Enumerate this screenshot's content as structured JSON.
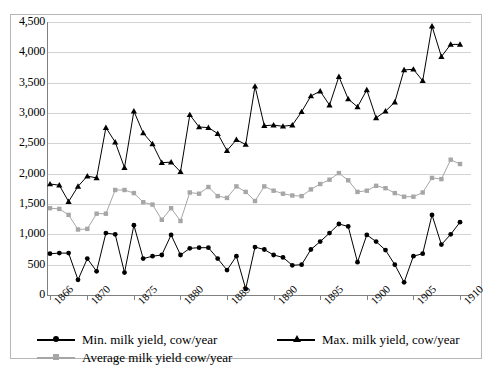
{
  "chart_data": {
    "type": "line",
    "title": "",
    "xlabel": "",
    "ylabel": "",
    "ylim": [
      0,
      4500
    ],
    "ytick_step": 500,
    "ytick_labels": [
      "4,500",
      "4,000",
      "3,500",
      "3,000",
      "2,500",
      "2,000",
      "1,500",
      "1,000",
      "500",
      "0"
    ],
    "ytick_values": [
      4500,
      4000,
      3500,
      3000,
      2500,
      2000,
      1500,
      1000,
      500,
      0
    ],
    "xtick_labels": [
      "1866",
      "1870",
      "1875",
      "1880",
      "1885",
      "1890",
      "1895",
      "1900",
      "1905",
      "1910"
    ],
    "xtick_values": [
      1866,
      1870,
      1875,
      1880,
      1885,
      1890,
      1895,
      1900,
      1905,
      1910
    ],
    "xlim": [
      1866,
      1910
    ],
    "grid": true,
    "legend_position": "bottom-left",
    "x": [
      1866,
      1867,
      1868,
      1869,
      1870,
      1871,
      1872,
      1873,
      1874,
      1875,
      1876,
      1877,
      1878,
      1879,
      1880,
      1881,
      1882,
      1883,
      1884,
      1885,
      1886,
      1887,
      1888,
      1889,
      1890,
      1891,
      1892,
      1893,
      1894,
      1895,
      1896,
      1897,
      1898,
      1899,
      1900,
      1901,
      1902,
      1903,
      1904,
      1905,
      1906,
      1907,
      1908,
      1909,
      1910
    ],
    "series": [
      {
        "name": "Min. milk yield, cow/year",
        "color": "#000000",
        "marker": "circle",
        "values": [
          680,
          690,
          690,
          250,
          600,
          390,
          1020,
          1000,
          370,
          1150,
          600,
          640,
          660,
          990,
          660,
          770,
          780,
          780,
          600,
          410,
          640,
          100,
          790,
          750,
          660,
          620,
          490,
          500,
          750,
          880,
          1020,
          1170,
          1130,
          540,
          990,
          880,
          740,
          500,
          210,
          640,
          680,
          1320,
          830,
          1000,
          1200
        ]
      },
      {
        "name": "Average milk yield cow/year",
        "color": "#a6a6a6",
        "marker": "square",
        "values": [
          1430,
          1420,
          1320,
          1080,
          1090,
          1340,
          1340,
          1730,
          1730,
          1680,
          1530,
          1490,
          1240,
          1430,
          1220,
          1690,
          1670,
          1780,
          1630,
          1600,
          1790,
          1700,
          1550,
          1790,
          1720,
          1670,
          1640,
          1630,
          1740,
          1830,
          1900,
          2010,
          1890,
          1700,
          1720,
          1800,
          1760,
          1680,
          1620,
          1620,
          1690,
          1930,
          1910,
          2230,
          2160
        ]
      },
      {
        "name": "Max. milk yield, cow/year",
        "color": "#000000",
        "marker": "triangle",
        "values": [
          1830,
          1810,
          1540,
          1790,
          1960,
          1930,
          2760,
          2520,
          2100,
          3030,
          2670,
          2490,
          2180,
          2190,
          2030,
          2970,
          2770,
          2760,
          2660,
          2380,
          2560,
          2480,
          3440,
          2790,
          2800,
          2780,
          2800,
          3020,
          3280,
          3360,
          3130,
          3600,
          3230,
          3100,
          3380,
          2920,
          3030,
          3180,
          3710,
          3720,
          3530,
          4430,
          3930,
          4130,
          4130
        ]
      }
    ]
  },
  "legend": {
    "items": [
      {
        "label": "Min. milk yield, cow/year",
        "marker": "dot",
        "swatch": "black"
      },
      {
        "label": "Max. milk yield, cow/year",
        "marker": "tri",
        "swatch": "black"
      },
      {
        "label": "Average milk yield cow/year",
        "marker": "sq",
        "swatch": "gray"
      }
    ]
  },
  "colors": {
    "series_black": "#000000",
    "series_gray": "#a6a6a6",
    "gridline": "#d3d3d3",
    "axis": "#808080",
    "frame": "#b7b7b7"
  }
}
